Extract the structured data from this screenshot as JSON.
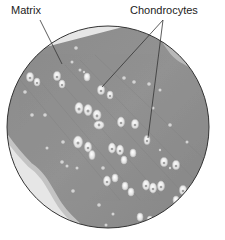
{
  "diagram": {
    "labels": {
      "matrix": "Matrix",
      "chondrocytes": "Chondrocytes"
    },
    "colors": {
      "matrix": "#8e8e8e",
      "matrix_dark": "#767676",
      "background_tissue": "#e4e4e4",
      "outline": "#333333",
      "cell": "#f4f4f4",
      "nucleus": "#9a9a9a"
    }
  }
}
